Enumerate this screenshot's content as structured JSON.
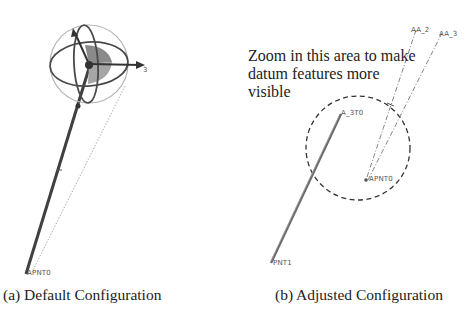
{
  "panels": [
    {
      "id": "a",
      "caption": "(a) Default Configuration",
      "labels": {
        "base_point": "APNT0",
        "axis_tip": "3"
      }
    },
    {
      "id": "b",
      "caption": "(b) Adjusted Configuration",
      "annotation": "Zoom in this area to make datum features more visible",
      "labels": {
        "axis_a2": "AA_2",
        "axis_a3": "AA_3",
        "top_point": "A_3T0",
        "apnt": "APNT0",
        "pnt1": "PNT1"
      }
    }
  ],
  "colors": {
    "line_dark": "#3a3a3a",
    "line_mid": "#6f6f6f",
    "shade": "#8c8c8c",
    "text": "#222222"
  }
}
